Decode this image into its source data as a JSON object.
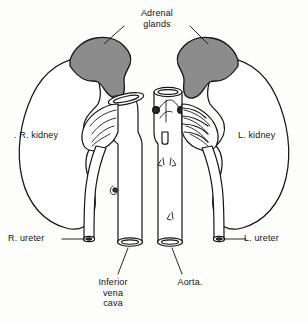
{
  "figure": {
    "type": "anatomical-line-diagram",
    "background_color": "#fdfdfc",
    "ink_color": "#161616",
    "gland_fill_color": "#8c8c8c"
  },
  "labels": {
    "adrenal_glands": "Adrenal\nglands",
    "right_kidney": ". R. kidney",
    "left_kidney": "L. kidney",
    "right_ureter": "R. ureter",
    "left_ureter": "L. ureter",
    "inferior_vena_cava": "Inferior\nvena\ncava",
    "aorta": "Aorta."
  },
  "structures": [
    {
      "name": "right-adrenal-gland",
      "fill": "#8c8c8c",
      "side": "right"
    },
    {
      "name": "left-adrenal-gland",
      "fill": "#8c8c8c",
      "side": "left"
    },
    {
      "name": "right-kidney",
      "fill": "#ffffff",
      "side": "right"
    },
    {
      "name": "left-kidney",
      "fill": "#ffffff",
      "side": "left"
    },
    {
      "name": "inferior-vena-cava",
      "fill": "#ffffff",
      "position": "center-left"
    },
    {
      "name": "aorta",
      "fill": "#ffffff",
      "position": "center-right"
    },
    {
      "name": "right-ureter",
      "fill": "#ffffff",
      "side": "right"
    },
    {
      "name": "left-ureter",
      "fill": "#ffffff",
      "side": "left"
    }
  ]
}
